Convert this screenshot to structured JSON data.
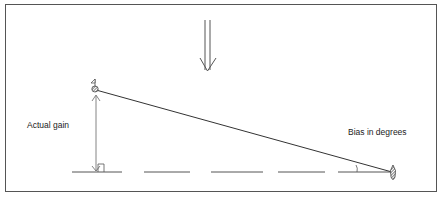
{
  "labels": {
    "actual_gain": "Actual gain",
    "bias": "Bias in degrees"
  },
  "colors": {
    "line": "#444444",
    "frame": "#555555",
    "text": "#222222"
  },
  "elements": {
    "incoming_arrow": "double-line-down-arrow-icon",
    "top_marker": "flag-on-rock-icon",
    "right_marker": "hatched-teardrop-icon",
    "right_angle": "right-angle-marker",
    "angle_arc": "angle-arc-marker"
  }
}
